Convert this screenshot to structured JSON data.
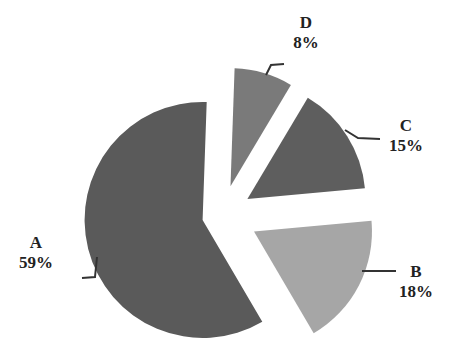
{
  "chart_data": {
    "type": "pie",
    "title": "",
    "exploded": true,
    "categories": [
      "A",
      "B",
      "C",
      "D"
    ],
    "values": [
      59,
      18,
      15,
      8
    ],
    "labels": [
      "59%",
      "18%",
      "15%",
      "8%"
    ],
    "colors": [
      "#5a5a5a",
      "#a6a6a6",
      "#5e5e5e",
      "#7a7a7a"
    ],
    "legend": "none",
    "data_labels": "outside with leader lines"
  },
  "labels": {
    "a": {
      "name": "A",
      "pct": "59%"
    },
    "b": {
      "name": "B",
      "pct": "18%"
    },
    "c": {
      "name": "C",
      "pct": "15%"
    },
    "d": {
      "name": "D",
      "pct": "8%"
    }
  }
}
